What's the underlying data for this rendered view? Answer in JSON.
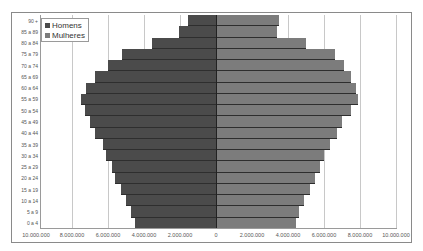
{
  "chart_data": {
    "type": "bar",
    "orientation": "horizontal",
    "subtype": "population-pyramid",
    "title": "",
    "xlabel": "",
    "ylabel": "",
    "categories": [
      "90 +",
      "85 a 89",
      "80 a 84",
      "75 a 79",
      "70 a 74",
      "65 a 69",
      "60 a 64",
      "55 a 59",
      "50 a 54",
      "45 a 49",
      "40 a 44",
      "35 a 39",
      "30 a 34",
      "25 a 29",
      "20 a 24",
      "15 a 19",
      "10 a 14",
      "5 a 9",
      "0 a 4"
    ],
    "series": [
      {
        "name": "Homens",
        "side": "left",
        "color": "#4b4b4b",
        "values": [
          1550000,
          2050000,
          3550000,
          5200000,
          6000000,
          6700000,
          7200000,
          7500000,
          7300000,
          7000000,
          6700000,
          6300000,
          6100000,
          5800000,
          5600000,
          5300000,
          5000000,
          4700000,
          4500000
        ]
      },
      {
        "name": "Mulheres",
        "side": "right",
        "color": "#7c7c7c",
        "values": [
          3500000,
          3400000,
          5000000,
          6600000,
          7100000,
          7500000,
          7800000,
          7900000,
          7500000,
          7000000,
          6700000,
          6350000,
          6000000,
          5750000,
          5500000,
          5200000,
          4900000,
          4600000,
          4450000
        ]
      }
    ],
    "x_ticks": [
      "10.000.000",
      "8.000.000",
      "6.000.000",
      "4.000.000",
      "2.000.000",
      "0",
      "2.000.000",
      "4.000.000",
      "6.000.000",
      "8.000.000",
      "10.000.000"
    ],
    "xlim": [
      -10000000,
      10000000
    ],
    "grid": true,
    "legend_position": "top-left"
  },
  "legend": {
    "items": [
      {
        "label": "Homens",
        "color": "#4b4b4b"
      },
      {
        "label": "Mulheres",
        "color": "#7c7c7c"
      }
    ]
  }
}
